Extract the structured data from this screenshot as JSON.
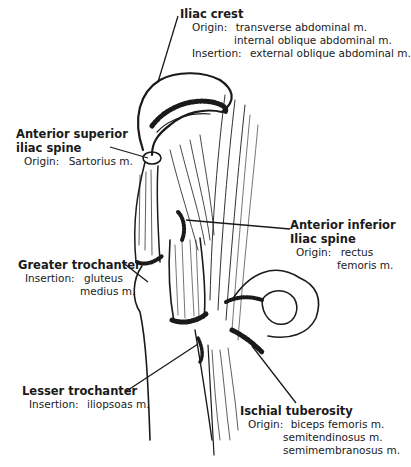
{
  "diagram": {
    "labels": [
      {
        "id": "iliac-crest",
        "title": "Iliac crest",
        "lines": [
          {
            "prefix": "Origin:",
            "text": "transverse abdominal m."
          },
          {
            "prefix": "",
            "text": "internal oblique abdominal m."
          },
          {
            "prefix": "Insertion:",
            "text": "external oblique abdominal m."
          }
        ]
      },
      {
        "id": "anterior-superior-iliac-spine",
        "title_lines": [
          "Anterior superior",
          "iliac spine"
        ],
        "lines": [
          {
            "prefix": "Origin:",
            "text": "Sartorius m."
          }
        ]
      },
      {
        "id": "anterior-inferior-iliac-spine",
        "title_lines": [
          "Anterior inferior",
          "Iliac spine"
        ],
        "lines": [
          {
            "prefix": "Origin:",
            "text": "rectus"
          },
          {
            "prefix": "",
            "text": "femoris m."
          }
        ]
      },
      {
        "id": "greater-trochanter",
        "title": "Greater trochanter",
        "lines": [
          {
            "prefix": "Insertion:",
            "text": "gluteus"
          },
          {
            "prefix": "",
            "text": "medius m."
          }
        ]
      },
      {
        "id": "lesser-trochanter",
        "title": "Lesser trochanter",
        "lines": [
          {
            "prefix": "Insertion:",
            "text": "iliopsoas m."
          }
        ]
      },
      {
        "id": "ischial-tuberosity",
        "title": "Ischial tuberosity",
        "lines": [
          {
            "prefix": "Origin:",
            "text": "biceps femoris m."
          },
          {
            "prefix": "",
            "text": "semitendinosus m."
          },
          {
            "prefix": "",
            "text": "semimembranosus m."
          }
        ]
      }
    ],
    "colors": {
      "ink": "#1a1a1a",
      "background": "#ffffff"
    }
  }
}
